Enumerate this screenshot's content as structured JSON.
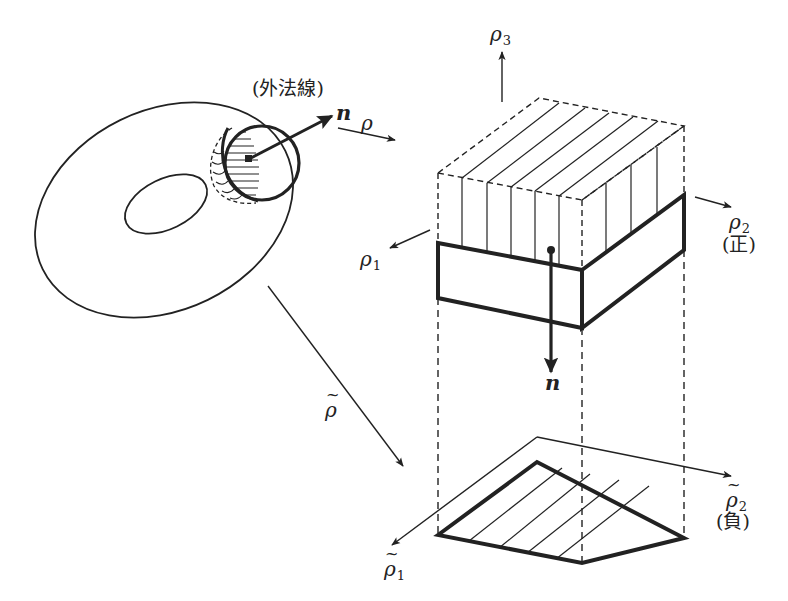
{
  "figure": {
    "colors": {
      "ink": "#222222",
      "background": "#ffffff"
    }
  },
  "labels": {
    "outward_normal": "(外法線)",
    "n_torus": "n",
    "rho_map": "ρ",
    "rho_tilde_map": "ρ",
    "rho3": "ρ",
    "rho3_sub": "3",
    "rho1": "ρ",
    "rho1_sub": "1",
    "rho2": "ρ",
    "rho2_sub": "2",
    "rho2_sign": "(正)",
    "n_box": "n",
    "rho1_tilde": "ρ",
    "rho1_tilde_sub": "1",
    "rho2_tilde": "ρ",
    "rho2_tilde_sub": "2",
    "rho2_tilde_sign": "(負)"
  }
}
